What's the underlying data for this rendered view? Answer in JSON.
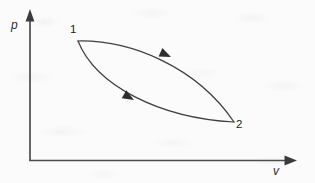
{
  "figure": {
    "kind": "pressure-volume-diagram",
    "background_color": "#fbfbfc",
    "ink_color": "#3f3f3f"
  },
  "axes": {
    "y_axis": {
      "label": "p",
      "name": "pressure-axis",
      "arrow_icon": "arrow-up-icon"
    },
    "x_axis": {
      "label": "v",
      "name": "volume-axis",
      "arrow_icon": "arrow-right-icon"
    },
    "origin": {
      "x": 30,
      "y": 160
    }
  },
  "chart_data": {
    "type": "line",
    "title": "",
    "xlabel": "v",
    "ylabel": "p",
    "grid": false,
    "legend": null,
    "annotations": [
      {
        "text": "1",
        "x": 73,
        "y": 30,
        "describes": "state-point-1"
      },
      {
        "text": "2",
        "x": 240,
        "y": 126,
        "describes": "state-point-2"
      }
    ],
    "state_points": [
      {
        "label": "1",
        "px": 78,
        "py": 41
      },
      {
        "label": "2",
        "px": 234,
        "py": 122
      }
    ],
    "series": [
      {
        "name": "upper-process-path",
        "from": "1",
        "to": "2",
        "direction": "forward",
        "path": "M 78 41 C 130 40, 196 66, 234 122",
        "arrow_at": {
          "x": 165,
          "y": 54,
          "angle_deg": 22
        }
      },
      {
        "name": "lower-process-path",
        "from": "1",
        "to": "2",
        "direction": "forward",
        "path": "M 78 41 C 96 86, 160 118, 234 122",
        "arrow_at": {
          "x": 128,
          "y": 97,
          "angle_deg": 35
        }
      }
    ]
  }
}
